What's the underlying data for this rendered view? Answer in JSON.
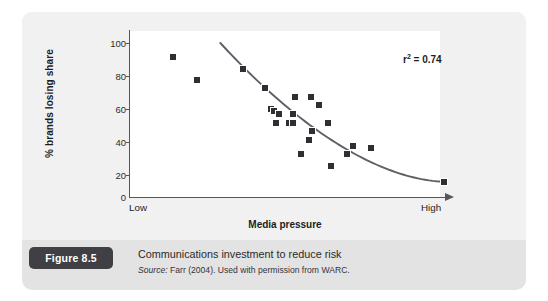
{
  "figure": {
    "badge_label": "Figure 8.5",
    "caption_title": "Communications investment to reduce risk",
    "source_prefix": "Source:",
    "source_text": "Farr (2004). Used with permission from WARC."
  },
  "chart_data": {
    "type": "scatter",
    "title": "",
    "xlabel": "Media pressure",
    "ylabel": "% brands losing share",
    "xlim": [
      0,
      100
    ],
    "ylim": [
      0,
      100
    ],
    "grid": false,
    "legend": null,
    "x_tick_labels": [
      "Low",
      "High"
    ],
    "y_tick_labels": [
      "0",
      "20",
      "40",
      "60",
      "80",
      "100"
    ],
    "y_ticks": [
      0,
      20,
      40,
      60,
      80,
      100
    ],
    "annotations": [
      {
        "text": "r² = 0.74",
        "symbol": "r",
        "superscript": "2",
        "value": "= 0.74"
      }
    ],
    "marker_color": "#2e2e33",
    "trend_color": "#5f6066",
    "points": [
      {
        "x": 13.5,
        "y": 91
      },
      {
        "x": 21.0,
        "y": 76
      },
      {
        "x": 35.5,
        "y": 83
      },
      {
        "x": 42.5,
        "y": 71
      },
      {
        "x": 44.5,
        "y": 57
      },
      {
        "x": 45.5,
        "y": 56
      },
      {
        "x": 47.0,
        "y": 54
      },
      {
        "x": 46.0,
        "y": 48
      },
      {
        "x": 50.0,
        "y": 48
      },
      {
        "x": 51.5,
        "y": 48
      },
      {
        "x": 51.5,
        "y": 54
      },
      {
        "x": 52.0,
        "y": 65
      },
      {
        "x": 57.0,
        "y": 65
      },
      {
        "x": 59.5,
        "y": 60
      },
      {
        "x": 56.5,
        "y": 37
      },
      {
        "x": 57.5,
        "y": 43
      },
      {
        "x": 62.5,
        "y": 48
      },
      {
        "x": 54.0,
        "y": 28
      },
      {
        "x": 63.5,
        "y": 20
      },
      {
        "x": 68.5,
        "y": 28
      },
      {
        "x": 70.5,
        "y": 33
      },
      {
        "x": 76.0,
        "y": 32
      },
      {
        "x": 99.0,
        "y": 10
      }
    ],
    "trend_curve": {
      "description": "fitted exponential decay trend line",
      "start": {
        "x": 28.5,
        "y": 100
      },
      "end": {
        "x": 99.0,
        "y": 10
      }
    }
  }
}
